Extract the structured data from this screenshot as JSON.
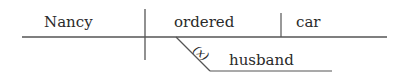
{
  "diagram": {
    "type": "sentence-diagram",
    "subject": "Nancy",
    "verb": "ordered",
    "direct_object": "car",
    "modifier": "husband",
    "modifier_marker": "(x)",
    "line_color": "#555555",
    "text_color": "#2a2a2a"
  }
}
